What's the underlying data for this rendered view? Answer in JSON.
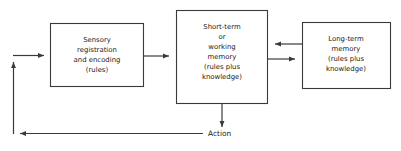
{
  "diagram": {
    "background_color": "#ffffff",
    "line_color": "#3a3a3a",
    "text_color": "#222222",
    "boxes": [
      {
        "id": "sensory",
        "lines": [
          "Sensory",
          "registration",
          "and encoding",
          "(rules)"
        ]
      },
      {
        "id": "short-term",
        "lines": [
          "Short-term",
          "or",
          "working",
          "memory",
          "(rules plus",
          "knowledge)"
        ]
      },
      {
        "id": "long-term",
        "lines": [
          "Long-term",
          "memory",
          "(rules plus",
          "knowledge)"
        ]
      }
    ],
    "labels": {
      "action": "Action"
    },
    "connections": [
      {
        "id": "sensory-to-stm",
        "direction": "right"
      },
      {
        "id": "ltm-to-stm",
        "direction": "left"
      },
      {
        "id": "stm-to-ltm",
        "direction": "right"
      },
      {
        "id": "stm-to-action",
        "direction": "down"
      },
      {
        "id": "action-feedback",
        "direction": "left"
      },
      {
        "id": "feedback-up",
        "direction": "up"
      },
      {
        "id": "feedback-to-sensory",
        "direction": "right"
      }
    ]
  }
}
